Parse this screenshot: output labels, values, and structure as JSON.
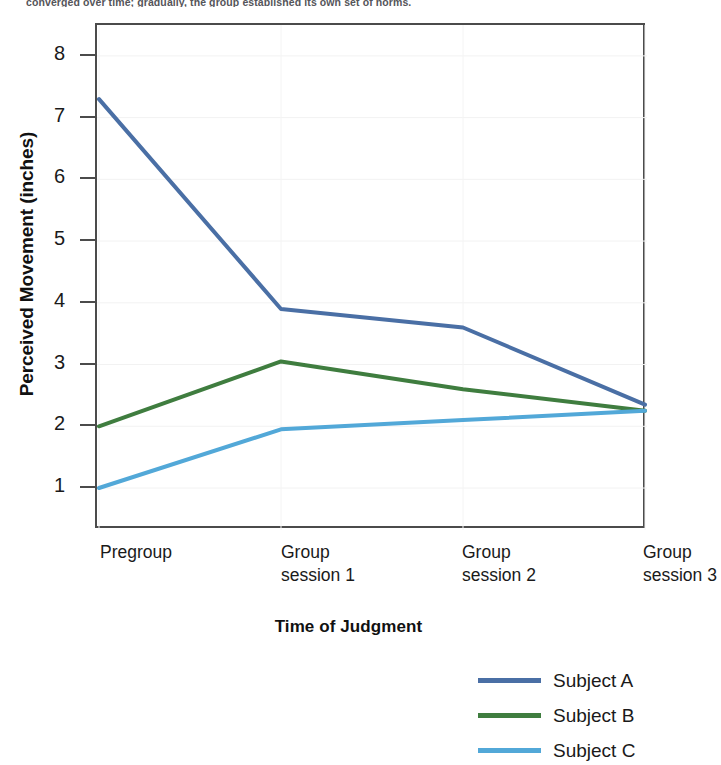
{
  "caption": {
    "text": "converged over time; gradually, the group established its own set of norms."
  },
  "chart_data": {
    "type": "line",
    "title": "",
    "xlabel": "Time of Judgment",
    "ylabel": "Perceived Movement (inches)",
    "categories": [
      "Pregroup",
      "Group session 1",
      "Group session 2",
      "Group session 3"
    ],
    "x_tick_lines": [
      [
        "Pregroup",
        ""
      ],
      [
        "Group",
        "session 1"
      ],
      [
        "Group",
        "session 2"
      ],
      [
        "Group",
        "session 3"
      ]
    ],
    "yticks": [
      1,
      2,
      3,
      4,
      5,
      6,
      7,
      8
    ],
    "ylim": [
      0.32,
      8.5
    ],
    "grid": false,
    "legend_position": "bottom-right",
    "series": [
      {
        "name": "Subject A",
        "color": "#4a6fa5",
        "values": [
          7.3,
          3.9,
          3.6,
          2.35
        ]
      },
      {
        "name": "Subject B",
        "color": "#3f7d3f",
        "values": [
          2.0,
          3.05,
          2.6,
          2.25
        ]
      },
      {
        "name": "Subject C",
        "color": "#52a8d8",
        "values": [
          1.0,
          1.95,
          2.1,
          2.25
        ]
      }
    ]
  }
}
